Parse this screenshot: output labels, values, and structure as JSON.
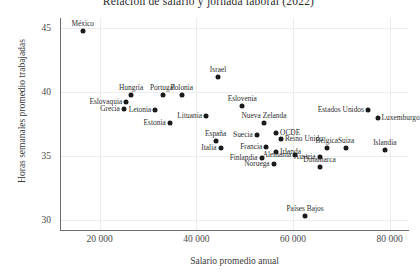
{
  "chart_data": {
    "type": "scatter",
    "title": "Relación de salario y jornada laboral (2022)",
    "xlabel": "Salario promedio anual",
    "ylabel": "Horas semanales promedio trabajadas",
    "xlim": [
      12000,
      84000
    ],
    "ylim": [
      29.2,
      45.8
    ],
    "xticks": [
      20000,
      40000,
      60000,
      80000
    ],
    "xticklabels": [
      "20 000",
      "40 000",
      "60 000",
      "80 000"
    ],
    "yticks": [
      30,
      35,
      40,
      45
    ],
    "yticklabels": [
      "30",
      "35",
      "40",
      "45"
    ],
    "grid": true,
    "legend": null,
    "point_color": "#1a1a1a",
    "points": [
      {
        "label": "México",
        "x": 16500,
        "y": 44.8,
        "lpos": "top"
      },
      {
        "label": "Israel",
        "x": 44500,
        "y": 41.2,
        "lpos": "top"
      },
      {
        "label": "Hungría",
        "x": 26500,
        "y": 39.8,
        "lpos": "top"
      },
      {
        "label": "Portugal",
        "x": 33000,
        "y": 39.8,
        "lpos": "top"
      },
      {
        "label": "Polonia",
        "x": 37000,
        "y": 39.8,
        "lpos": "top"
      },
      {
        "label": "Eslovaquia",
        "x": 25500,
        "y": 39.2,
        "lpos": "left"
      },
      {
        "label": "Grecia",
        "x": 25000,
        "y": 38.7,
        "lpos": "left"
      },
      {
        "label": "Eslovenia",
        "x": 49500,
        "y": 38.9,
        "lpos": "top"
      },
      {
        "label": "Letonia",
        "x": 31500,
        "y": 38.6,
        "lpos": "left"
      },
      {
        "label": "Estados Unidos",
        "x": 75500,
        "y": 38.6,
        "lpos": "left"
      },
      {
        "label": "Luxemburgo",
        "x": 77500,
        "y": 38.0,
        "lpos": "right"
      },
      {
        "label": "Lituania",
        "x": 42000,
        "y": 38.1,
        "lpos": "left"
      },
      {
        "label": "Estonia",
        "x": 34500,
        "y": 37.6,
        "lpos": "left"
      },
      {
        "label": "Nueva Zelanda",
        "x": 54000,
        "y": 37.6,
        "lpos": "top"
      },
      {
        "label": "OCDE",
        "x": 56500,
        "y": 36.8,
        "lpos": "right"
      },
      {
        "label": "Suecia",
        "x": 52500,
        "y": 36.6,
        "lpos": "left"
      },
      {
        "label": "Reino Unido",
        "x": 57500,
        "y": 36.3,
        "lpos": "right"
      },
      {
        "label": "España",
        "x": 44000,
        "y": 36.2,
        "lpos": "top"
      },
      {
        "label": "Islandia",
        "x": 79000,
        "y": 35.5,
        "lpos": "top"
      },
      {
        "label": "Suiza",
        "x": 71000,
        "y": 35.6,
        "lpos": "top"
      },
      {
        "label": "Italia",
        "x": 45000,
        "y": 35.6,
        "lpos": "left"
      },
      {
        "label": "Francia",
        "x": 54500,
        "y": 35.7,
        "lpos": "left"
      },
      {
        "label": "Bélgica",
        "x": 67000,
        "y": 35.6,
        "lpos": "top"
      },
      {
        "label": "Irlanda",
        "x": 56500,
        "y": 35.3,
        "lpos": "right"
      },
      {
        "label": "Alemania",
        "x": 60500,
        "y": 35.1,
        "lpos": "left"
      },
      {
        "label": "Austria",
        "x": 65500,
        "y": 34.9,
        "lpos": "left"
      },
      {
        "label": "Finlandia",
        "x": 53500,
        "y": 34.8,
        "lpos": "left"
      },
      {
        "label": "Noruega",
        "x": 56000,
        "y": 34.4,
        "lpos": "left"
      },
      {
        "label": "Dinamarca",
        "x": 65500,
        "y": 34.1,
        "lpos": "top"
      },
      {
        "label": "Países Bajos",
        "x": 62500,
        "y": 30.3,
        "lpos": "top"
      }
    ]
  }
}
